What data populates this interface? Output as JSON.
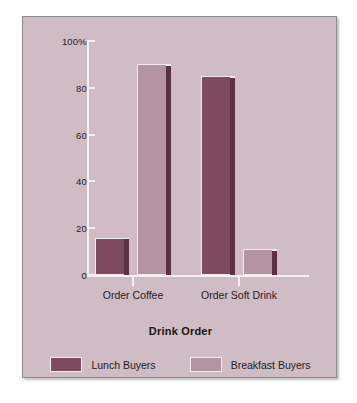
{
  "chart_data": {
    "type": "bar",
    "title": "",
    "xlabel": "Drink Order",
    "ylabel": "",
    "categories": [
      "Order Coffee",
      "Order Soft Drink"
    ],
    "series": [
      {
        "name": "Lunch Buyers",
        "values": [
          16,
          85
        ],
        "color": "#7d4a5e"
      },
      {
        "name": "Breakfast Buyers",
        "values": [
          90,
          11
        ],
        "color": "#b295a1"
      }
    ],
    "ylim": [
      0,
      100
    ],
    "yticks": [
      0,
      20,
      40,
      60,
      80,
      100
    ],
    "ytick_labels": [
      "0",
      "20",
      "40",
      "60",
      "80",
      "100%"
    ],
    "grid": false,
    "legend_position": "bottom"
  },
  "colors": {
    "panel_background": "#cfbcc4",
    "page_background": "#ffffff",
    "axis": "#f5f1f3",
    "text": "#241b1f",
    "lunch_buyers": "#7d4a5e",
    "breakfast_buyers": "#b295a1",
    "bar_side_shadow": "#5d2f45",
    "panel_border": "#8c8c8c"
  }
}
